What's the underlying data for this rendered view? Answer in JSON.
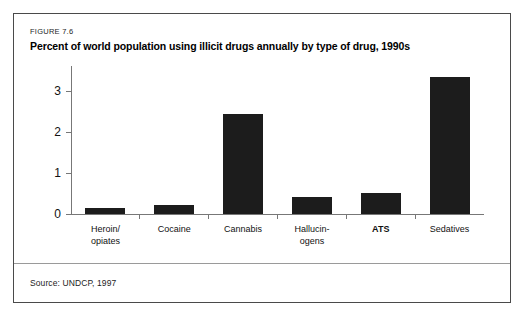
{
  "figure": {
    "number_label": "FIGURE 7.6",
    "title": "Percent of world population using illicit drugs annually by type of drug, 1990s",
    "source_note": "Source: UNDCP, 1997"
  },
  "colors": {
    "bar_fill": "#1c1c1c",
    "axis": "#777777",
    "frame_border": "#4a4a4a",
    "background": "#ffffff"
  },
  "chart_data": {
    "type": "bar",
    "title": "Percent of world population using illicit drugs annually by type of drug, 1990s",
    "xlabel": "",
    "ylabel": "",
    "ylim": [
      0,
      3.7
    ],
    "yticks": [
      "0",
      "1",
      "2",
      "3"
    ],
    "ytick_values": [
      0,
      1,
      2,
      3
    ],
    "grid": false,
    "legend": "none",
    "categories": [
      "Heroin/\nopiates",
      "Cocaine",
      "Cannabis",
      "Hallucin-\nogens",
      "ATS",
      "Sedatives"
    ],
    "category_lines": [
      [
        "Heroin/",
        "opiates"
      ],
      [
        "Cocaine"
      ],
      [
        "Cannabis"
      ],
      [
        "Hallucin-",
        "ogens"
      ],
      [
        "ATS"
      ],
      [
        "Sedatives"
      ]
    ],
    "category_emphasis": [
      false,
      false,
      false,
      false,
      true,
      false
    ],
    "values": [
      0.15,
      0.22,
      2.45,
      0.42,
      0.52,
      3.35
    ]
  }
}
